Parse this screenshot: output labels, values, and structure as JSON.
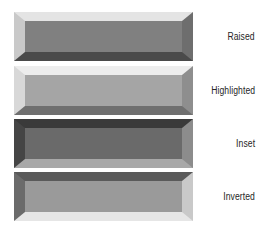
{
  "figure": {
    "background_color": "#ffffff",
    "label_color": "#262626"
  },
  "swatches": [
    {
      "label": "Raised",
      "effect": "raised",
      "face_color": "#808080",
      "bevel_top_color": "#e4e4e4",
      "bevel_left_color": "#c9c9c9",
      "bevel_right_color": "#6e6e6e",
      "bevel_bottom_color": "#4a4a4a",
      "top": 12,
      "height": 49
    },
    {
      "label": "Highlighted",
      "effect": "highlighted",
      "face_color": "#a5a5a5",
      "bevel_top_color": "#ededed",
      "bevel_left_color": "#d8d8d8",
      "bevel_right_color": "#8e8e8e",
      "bevel_bottom_color": "#6f6f6f",
      "top": 66,
      "height": 49
    },
    {
      "label": "Inset",
      "effect": "inset",
      "face_color": "#6a6a6a",
      "bevel_top_color": "#3a3a3a",
      "bevel_left_color": "#454545",
      "bevel_right_color": "#8c8c8c",
      "bevel_bottom_color": "#a8a8a8",
      "top": 119,
      "height": 49
    },
    {
      "label": "Inverted",
      "effect": "inverted",
      "face_color": "#9a9a9a",
      "bevel_top_color": "#5a5a5a",
      "bevel_left_color": "#6b6b6b",
      "bevel_right_color": "#c9c9c9",
      "bevel_bottom_color": "#e6e6e6",
      "top": 172,
      "height": 49
    }
  ]
}
